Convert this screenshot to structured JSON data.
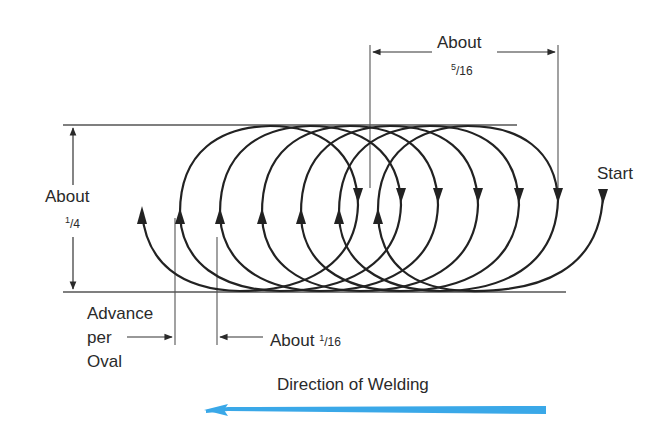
{
  "diagram": {
    "labels": {
      "width_about": "About",
      "width_fraction_num": "5",
      "width_fraction_den": "/16",
      "height_about": "About",
      "height_fraction_num": "1",
      "height_fraction_den": "/4",
      "start": "Start",
      "advance_line1": "Advance",
      "advance_line2": "per",
      "advance_line3": "Oval",
      "advance_about": "About ",
      "advance_fraction_num": "1",
      "advance_fraction_den": "/16",
      "direction": "Direction of Welding"
    },
    "colors": {
      "line": "#2a2a2a",
      "direction_arrow": "#3aa8e8"
    },
    "loops": [
      {
        "left_x": 180,
        "right_x": 358
      },
      {
        "left_x": 220,
        "right_x": 401
      },
      {
        "left_x": 262,
        "right_x": 438
      },
      {
        "left_x": 301,
        "right_x": 478
      },
      {
        "left_x": 339,
        "right_x": 519
      },
      {
        "left_x": 378,
        "right_x": 558
      }
    ],
    "start_point": {
      "x": 603,
      "y": 190
    },
    "end_point": {
      "x": 142,
      "y": 210
    }
  }
}
